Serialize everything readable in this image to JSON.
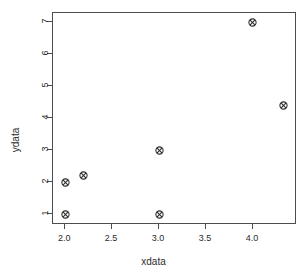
{
  "chart_data": {
    "type": "scatter",
    "title": "",
    "xlabel": "xdata",
    "ylabel": "ydata",
    "xlim": [
      1.87,
      4.47
    ],
    "ylim": [
      0.66,
      7.29
    ],
    "grid": false,
    "legend": null,
    "marker": {
      "name": "circle-x-marker",
      "pch": 13,
      "color": "#2b2b2b",
      "size_px": 9
    },
    "xticks": [
      {
        "value": 2.0,
        "label": "2.0"
      },
      {
        "value": 2.5,
        "label": "2.5"
      },
      {
        "value": 3.0,
        "label": "3.0"
      },
      {
        "value": 3.5,
        "label": "3.5"
      },
      {
        "value": 4.0,
        "label": "4.0"
      }
    ],
    "yticks": [
      {
        "value": 1,
        "label": "1"
      },
      {
        "value": 2,
        "label": "2"
      },
      {
        "value": 3,
        "label": "3"
      },
      {
        "value": 4,
        "label": "4"
      },
      {
        "value": 5,
        "label": "5"
      },
      {
        "value": 6,
        "label": "6"
      },
      {
        "value": 7,
        "label": "7"
      }
    ],
    "points": [
      {
        "x": 2.0,
        "y": 1.0
      },
      {
        "x": 2.0,
        "y": 2.0
      },
      {
        "x": 2.2,
        "y": 2.2
      },
      {
        "x": 3.0,
        "y": 1.0
      },
      {
        "x": 3.0,
        "y": 3.0
      },
      {
        "x": 4.0,
        "y": 7.0
      },
      {
        "x": 4.33,
        "y": 4.4
      }
    ]
  },
  "axis_titles": {
    "x": "xdata",
    "y": "ydata"
  },
  "colors": {
    "axis": "#4d4d4d",
    "text": "#2b2b2b",
    "marker": "#2b2b2b",
    "background": "#ffffff"
  }
}
